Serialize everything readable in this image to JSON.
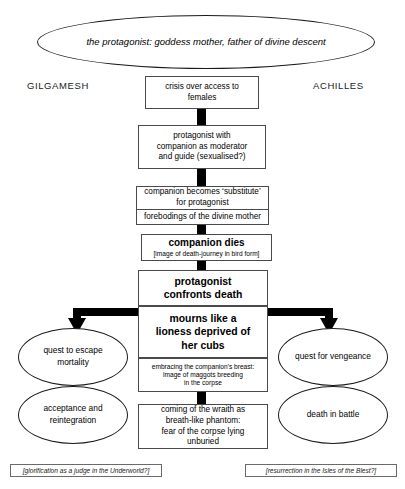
{
  "diagram": {
    "title_ellipse": {
      "line1": "the protagonist:",
      "line2": "goddess mother, father of divine descent"
    },
    "headings": {
      "left": "GILGAMESH",
      "right": "ACHILLES"
    },
    "central_nodes": {
      "crisis": {
        "line1": "crisis over access to",
        "line2": "females"
      },
      "companion_moderator": {
        "line1": "protagonist with",
        "line2": "companion as moderator",
        "line3": "and guide (sexualised?)"
      },
      "substitute": {
        "line1": "companion becomes ‘substitute’",
        "line2": "for protagonist"
      },
      "forebodings": {
        "line1": "forebodings of the divine mother"
      },
      "companion_dies": {
        "line1": "companion dies",
        "line2": "[image of death-journey in bird form]"
      },
      "confronts_death": {
        "line1": "protagonist",
        "line2": "confronts death"
      },
      "mourns": {
        "line1": "mourns like a",
        "line2": "lioness deprived of",
        "line3": "her cubs"
      },
      "embracing": {
        "line1": "embracing the companion’s breast:",
        "line2": "image of maggots breeding",
        "line3": "in the corpse"
      },
      "wraith": {
        "line1": "coming of the wraith as",
        "line2": "breath-like phantom:",
        "line3": "fear of the corpse lying",
        "line4": "unburied"
      }
    },
    "left_branch": {
      "outcome_1": {
        "line1": "quest to",
        "line2": "escape",
        "line3": "mortality"
      },
      "outcome_2": {
        "line1": "acceptance",
        "line2": "and",
        "line3": "reintegration"
      },
      "caption": "[glorification as a judge in the Underworld?]"
    },
    "right_branch": {
      "outcome_1": {
        "line1": "quest for",
        "line2": "vengeance"
      },
      "outcome_2": {
        "line1": "death in battle"
      },
      "caption": "[resurrection in the Isles of the Blest?]"
    },
    "colors": {
      "stroke": "#4a4a4a",
      "connector": "#000000",
      "ellipse_stroke": "#1a1a1a",
      "background": "#ffffff"
    }
  }
}
